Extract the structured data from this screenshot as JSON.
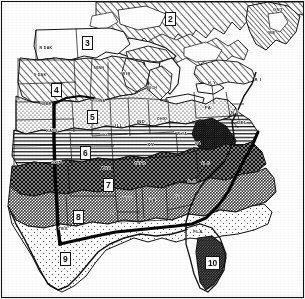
{
  "map": {
    "title": "Climatic Zone Map of the Eastern and Central United States",
    "type": "thematic-zone-map",
    "style": "black-and-white scanned line map with pattern fills",
    "frame_color": "#111111",
    "background_color": "#ffffff",
    "ink_color": "#111111",
    "meridian_line": {
      "name": "98th-meridian-boundary",
      "description": "heavy vertical black line through the central plains",
      "color": "#000000"
    },
    "zones": [
      {
        "id": "2",
        "label": "2",
        "x": 170,
        "y": 18,
        "fill": "diagonal-hatch"
      },
      {
        "id": "3",
        "label": "3",
        "x": 87,
        "y": 42,
        "fill": "white"
      },
      {
        "id": "4",
        "label": "4",
        "x": 56,
        "y": 89,
        "fill": "diagonal-hatch"
      },
      {
        "id": "5",
        "label": "5",
        "x": 92,
        "y": 116,
        "fill": "fine-stipple"
      },
      {
        "id": "6",
        "label": "6",
        "x": 85,
        "y": 152,
        "fill": "horizontal-lines"
      },
      {
        "id": "7",
        "label": "7",
        "x": 108,
        "y": 184,
        "fill": "dense-crosshatch"
      },
      {
        "id": "8",
        "label": "8",
        "x": 78,
        "y": 216,
        "fill": "mid-gray"
      },
      {
        "id": "9",
        "label": "9",
        "x": 65,
        "y": 258,
        "fill": "light-stipple"
      },
      {
        "id": "10",
        "label": "10",
        "x": 212,
        "y": 262,
        "fill": "dark-gray"
      }
    ],
    "states": [
      {
        "abbr": "N DAK",
        "x": 46,
        "y": 48
      },
      {
        "abbr": "S DAK",
        "x": 40,
        "y": 75
      },
      {
        "abbr": "NEBR",
        "x": 46,
        "y": 104
      },
      {
        "abbr": "KANS",
        "x": 52,
        "y": 131
      },
      {
        "abbr": "OKLA",
        "x": 57,
        "y": 163
      },
      {
        "abbr": "TEX",
        "x": 63,
        "y": 228
      },
      {
        "abbr": "MINN",
        "x": 99,
        "y": 68
      },
      {
        "abbr": "WIS",
        "x": 126,
        "y": 73
      },
      {
        "abbr": "IOWA",
        "x": 100,
        "y": 101
      },
      {
        "abbr": "MO",
        "x": 104,
        "y": 134
      },
      {
        "abbr": "ARK",
        "x": 106,
        "y": 168
      },
      {
        "abbr": "LA",
        "x": 114,
        "y": 213
      },
      {
        "abbr": "MISS",
        "x": 127,
        "y": 199
      },
      {
        "abbr": "ALA",
        "x": 151,
        "y": 199
      },
      {
        "abbr": "GA",
        "x": 179,
        "y": 196
      },
      {
        "abbr": "FLA",
        "x": 198,
        "y": 231
      },
      {
        "abbr": "S C",
        "x": 192,
        "y": 181
      },
      {
        "abbr": "N C",
        "x": 206,
        "y": 163
      },
      {
        "abbr": "TENN",
        "x": 140,
        "y": 164
      },
      {
        "abbr": "KY",
        "x": 151,
        "y": 144
      },
      {
        "abbr": "ILL",
        "x": 119,
        "y": 125
      },
      {
        "abbr": "IND",
        "x": 141,
        "y": 121
      },
      {
        "abbr": "OHIO",
        "x": 162,
        "y": 119
      },
      {
        "abbr": "MICH",
        "x": 152,
        "y": 88
      },
      {
        "abbr": "W VA",
        "x": 182,
        "y": 134
      },
      {
        "abbr": "VA",
        "x": 198,
        "y": 143
      },
      {
        "abbr": "PA",
        "x": 208,
        "y": 107
      },
      {
        "abbr": "N Y",
        "x": 212,
        "y": 82
      },
      {
        "abbr": "N J",
        "x": 235,
        "y": 112
      },
      {
        "abbr": "DEL",
        "x": 242,
        "y": 122
      },
      {
        "abbr": "R I",
        "x": 258,
        "y": 79
      },
      {
        "abbr": "ONT",
        "x": 278,
        "y": 9
      },
      {
        "abbr": "ME",
        "x": 272,
        "y": 32
      }
    ],
    "legend_note": ""
  }
}
